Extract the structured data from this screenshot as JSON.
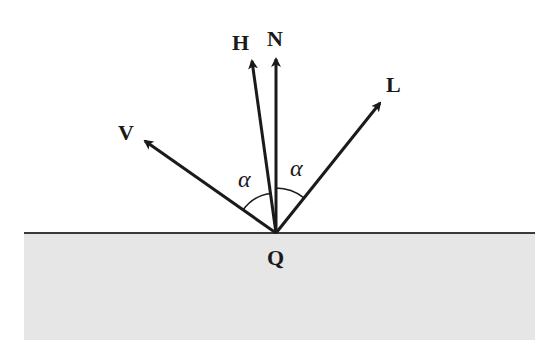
{
  "diagram": {
    "colors": {
      "surface_fill": "#e6e6e6",
      "surface_line": "#3a3a3a",
      "vector": "#1a1a1a",
      "background": "#ffffff"
    },
    "labels": {
      "V": "V",
      "H": "H",
      "N": "N",
      "L": "L",
      "Q": "Q",
      "alpha_left": "α",
      "alpha_right": "α"
    },
    "vectors": [
      {
        "id": "V",
        "label": "V",
        "meaning": "view direction"
      },
      {
        "id": "H",
        "label": "H",
        "meaning": "halfway vector"
      },
      {
        "id": "N",
        "label": "N",
        "meaning": "surface normal"
      },
      {
        "id": "L",
        "label": "L",
        "meaning": "light direction"
      }
    ],
    "angles": [
      {
        "label": "α",
        "between": [
          "V",
          "H"
        ]
      },
      {
        "label": "α",
        "between": [
          "H",
          "L"
        ]
      }
    ],
    "point": {
      "label": "Q",
      "meaning": "surface point"
    }
  }
}
